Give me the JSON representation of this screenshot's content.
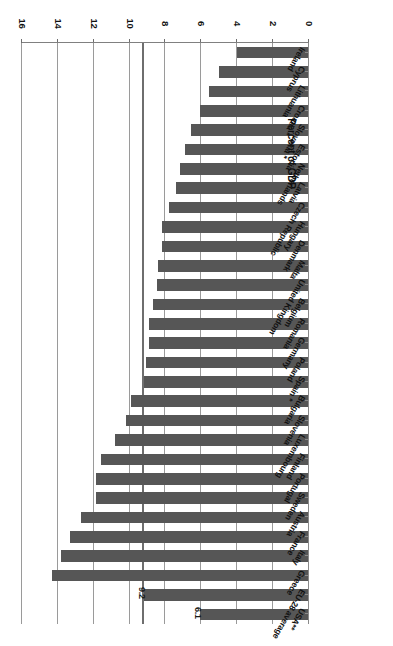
{
  "chart_data": {
    "type": "bar",
    "orientation": "horizontal",
    "title": "",
    "xlabel": "Percent of GDP",
    "ylabel": "",
    "xlim": [
      0,
      16
    ],
    "xticks": [
      0,
      2,
      4,
      6,
      8,
      10,
      12,
      14,
      16
    ],
    "grid": true,
    "legend": null,
    "bar_color": "#565656",
    "categories": [
      "USA**",
      "EU-28 average",
      "Greece",
      "Italy",
      "France",
      "Austria",
      "Sweden",
      "Portugal",
      "Finland",
      "Luxembourg",
      "Slovenia",
      "Bulgaria",
      "Spain *",
      "Poland",
      "Germany",
      "Romania",
      "Belgium",
      "United Kingdom",
      "Malta",
      "Denmark",
      "Hungary",
      "Czech Republic",
      "Latvia",
      "Netherlands",
      "Estonia",
      "Slovakia *",
      "Croatia *",
      "Lithuania",
      "Cyprus",
      "Ireland"
    ],
    "values": [
      6.1,
      9.2,
      14.3,
      13.8,
      13.3,
      12.7,
      11.9,
      11.9,
      11.6,
      10.8,
      10.2,
      9.9,
      9.2,
      9.1,
      8.9,
      8.9,
      8.7,
      8.5,
      8.4,
      8.2,
      8.2,
      7.8,
      7.4,
      7.2,
      6.9,
      6.6,
      6.1,
      5.6,
      5.0,
      4.0
    ],
    "data_labels": {
      "USA**": "6.1",
      "EU-28 average": "9.2"
    },
    "reference_lines": [
      9.2
    ]
  }
}
